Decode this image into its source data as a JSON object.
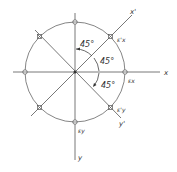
{
  "diagram": {
    "axes": {
      "x_label": "x",
      "y_label": "y",
      "x_prime_label": "x'",
      "y_prime_label": "y'"
    },
    "angles": [
      "45°",
      "45°",
      "45°"
    ],
    "strain_labels": {
      "ex": "εx",
      "ey": "εy",
      "ex_prime": "ε'x",
      "ey_prime": "ε'y"
    },
    "colors": {
      "line": "#555555",
      "text": "#333333",
      "background": "#ffffff"
    }
  }
}
